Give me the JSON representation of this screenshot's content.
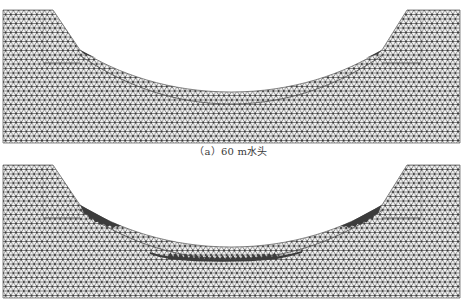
{
  "figure": {
    "type": "finite-element mesh comparison (canal / slope cross-section)",
    "panels": [
      {
        "id": "a",
        "caption": "（a）60 m水头",
        "damage_level": "minor"
      },
      {
        "id": "b",
        "caption": "",
        "damage_level": "extensive"
      }
    ]
  },
  "colors": {
    "background": "#ffffff",
    "mesh_line": "#5e5e5e",
    "mesh_node": "#333333",
    "mesh_fill": "#f4f4f4",
    "damage_zone": "#3c3c3c",
    "boundary_line": "#4a4a4a"
  }
}
